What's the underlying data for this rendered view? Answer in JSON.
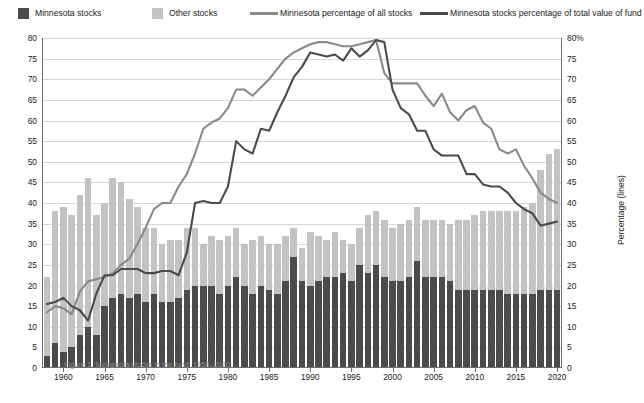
{
  "legend": {
    "items": [
      {
        "name": "minnesota-stocks",
        "label": "Minnesota stocks",
        "kind": "swatch",
        "color": "#4b4b4b"
      },
      {
        "name": "other-stocks",
        "label": "Other stocks",
        "kind": "swatch",
        "color": "#c3c3c3"
      },
      {
        "name": "minnesota-percentage-all-stocks",
        "label": "Minnesota percentage of all stocks",
        "kind": "line",
        "color": "#8a8a8a"
      },
      {
        "name": "minnesota-stocks-percentage-total-value",
        "label": "Minnesota stocks percentage of total value of fund",
        "kind": "line",
        "color": "#4b4b4b"
      }
    ]
  },
  "caption": {
    "text": "Figure 1. Minnesota stocks in the fund, 1958–2020"
  },
  "chart_data": {
    "type": "bar",
    "title": "",
    "xlabel": "",
    "ylabel": "Number of stocks in fund (bars)",
    "y2label": "Percentage (lines)",
    "ylim": [
      0,
      80
    ],
    "y2lim": [
      0,
      80
    ],
    "yticks": [
      0,
      5,
      10,
      15,
      20,
      25,
      30,
      35,
      40,
      45,
      50,
      55,
      60,
      65,
      70,
      75,
      80
    ],
    "yticklabels": [
      "0",
      "5",
      "10",
      "15",
      "20",
      "25",
      "30",
      "35",
      "40",
      "45",
      "50",
      "55",
      "60",
      "65",
      "70",
      "75",
      "80"
    ],
    "y2ticklabels": [
      "0",
      "5",
      "10",
      "15",
      "20",
      "25",
      "30",
      "35",
      "40",
      "45",
      "50",
      "55",
      "60",
      "65",
      "70",
      "75",
      "80%"
    ],
    "xticks": [
      1960,
      1965,
      1970,
      1975,
      1980,
      1985,
      1990,
      1995,
      2000,
      2005,
      2010,
      2015,
      2020
    ],
    "xlim": [
      1957.4,
      2020.6
    ],
    "grid": true,
    "legend_position": "top",
    "x": [
      1958,
      1959,
      1960,
      1961,
      1962,
      1963,
      1964,
      1965,
      1966,
      1967,
      1968,
      1969,
      1970,
      1971,
      1972,
      1973,
      1974,
      1975,
      1976,
      1977,
      1978,
      1979,
      1980,
      1981,
      1982,
      1983,
      1984,
      1985,
      1986,
      1987,
      1988,
      1989,
      1990,
      1991,
      1992,
      1993,
      1994,
      1995,
      1996,
      1997,
      1998,
      1999,
      2000,
      2001,
      2002,
      2003,
      2004,
      2005,
      2006,
      2007,
      2008,
      2009,
      2010,
      2011,
      2012,
      2013,
      2014,
      2015,
      2016,
      2017,
      2018,
      2019,
      2020
    ],
    "series": [
      {
        "name": "Minnesota stocks",
        "kind": "bar-segment",
        "color": "#4b4b4b",
        "values": [
          3,
          6,
          4,
          5,
          8,
          10,
          8,
          15,
          17,
          18,
          17,
          18,
          16,
          18,
          16,
          16,
          17,
          19,
          20,
          20,
          20,
          18,
          20,
          22,
          20,
          18,
          20,
          19,
          18,
          21,
          27,
          21,
          20,
          21,
          22,
          22,
          23,
          21,
          25,
          23,
          25,
          22,
          21,
          21,
          22,
          26,
          22,
          22,
          22,
          21,
          19,
          19,
          19,
          19,
          19,
          19,
          18,
          18,
          18,
          18,
          19,
          19,
          19
        ]
      },
      {
        "name": "Other stocks",
        "kind": "bar-segment",
        "color": "#c3c3c3",
        "values": [
          19,
          32,
          35,
          32,
          34,
          36,
          29,
          25,
          29,
          27,
          24,
          21,
          18,
          16,
          14,
          15,
          14,
          15,
          14,
          10,
          12,
          13,
          12,
          12,
          10,
          13,
          12,
          11,
          12,
          11,
          7,
          8,
          13,
          11,
          9,
          11,
          8,
          9,
          9,
          14,
          13,
          14,
          13,
          14,
          14,
          13,
          14,
          14,
          14,
          14,
          17,
          17,
          18,
          19,
          19,
          19,
          20,
          20,
          21,
          22,
          29,
          33,
          34
        ]
      },
      {
        "name": "Minnesota percentage of all stocks",
        "kind": "line",
        "color": "#8a8a8a",
        "axis": "right",
        "values": [
          13.5,
          15.0,
          14.5,
          13.0,
          18.5,
          21.0,
          21.5,
          22.0,
          23.0,
          25.0,
          26.5,
          30.0,
          34.0,
          38.5,
          40.0,
          40.0,
          44.0,
          47.0,
          52.0,
          58.0,
          59.5,
          60.5,
          63.0,
          67.5,
          67.5,
          66.0,
          68.0,
          70.0,
          72.5,
          75.0,
          76.5,
          77.5,
          78.5,
          79.0,
          79.0,
          78.5,
          78.0,
          78.0,
          78.5,
          79.0,
          79.5,
          71.5,
          69.0,
          69.0,
          69.0,
          69.0,
          66.0,
          63.5,
          66.5,
          62.0,
          60.0,
          62.5,
          63.5,
          59.5,
          58.0,
          53.0,
          52.0,
          53.0,
          49.0,
          46.0,
          42.5,
          41.0,
          40.0
        ]
      },
      {
        "name": "Minnesota stocks percentage of total value of fund",
        "kind": "line",
        "color": "#4b4b4b",
        "axis": "right",
        "values": [
          15.5,
          16.0,
          17.0,
          15.0,
          14.0,
          11.5,
          18.0,
          22.5,
          22.5,
          24.0,
          24.0,
          24.0,
          23.0,
          23.0,
          23.5,
          23.5,
          22.5,
          28.0,
          40.0,
          40.5,
          40.0,
          40.0,
          44.0,
          55.0,
          53.0,
          52.0,
          58.0,
          57.5,
          62.0,
          66.0,
          70.5,
          73.0,
          76.5,
          76.0,
          75.5,
          76.0,
          74.5,
          77.5,
          75.5,
          77.0,
          79.5,
          79.0,
          67.5,
          63.0,
          61.5,
          57.5,
          57.5,
          53.0,
          51.5,
          51.5,
          51.5,
          47.0,
          47.0,
          44.5,
          44.0,
          44.0,
          42.5,
          40.0,
          38.5,
          37.5,
          34.5,
          35.0,
          35.5
        ]
      }
    ]
  }
}
